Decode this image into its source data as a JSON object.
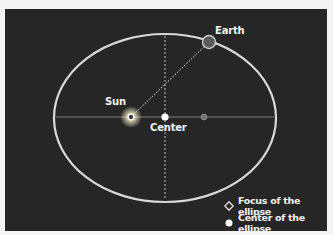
{
  "diagram": {
    "type": "elliptical-orbit",
    "labels": {
      "earth": "Earth",
      "sun": "Sun",
      "center": "Center"
    },
    "legend": [
      {
        "icon": "diamond-focus-icon",
        "label": "Focus of the ellipse"
      },
      {
        "icon": "dot-center-icon",
        "label": "Center of the ellipse"
      }
    ],
    "colors": {
      "background": "#262626",
      "orbit": "#d9d9d9",
      "axes": "#8a8a8a",
      "earth": "#5a5a5a",
      "sun_glow": "#fff7d6",
      "text": "#f2f2f2"
    }
  }
}
